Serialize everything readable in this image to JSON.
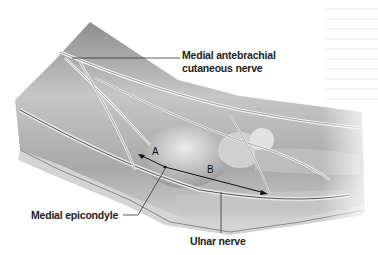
{
  "figure": {
    "labels": {
      "medial_antebrachial": "Medial antebrachial",
      "cutaneous_nerve": "cutaneous nerve",
      "medial_epicondyle": "Medial epicondyle",
      "ulnar_nerve": "Ulnar nerve"
    },
    "markers": {
      "a": "A",
      "b": "B"
    },
    "colors": {
      "background": "#ffffff",
      "limb_light": "#e6e6e6",
      "limb_mid": "#b4b4b4",
      "limb_dark": "#7a7a7a",
      "label_text": "#222222",
      "leader_line": "#333333"
    }
  }
}
